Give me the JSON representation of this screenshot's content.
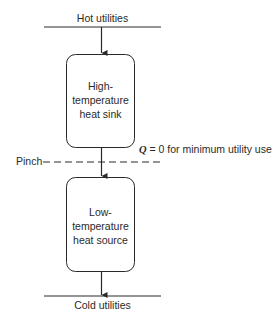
{
  "diagram": {
    "hot_utilities_label": "Hot utilities",
    "cold_utilities_label": "Cold utilities",
    "pinch_label": "Pinch",
    "upper_box": {
      "line1": "High-",
      "line2": "temperature",
      "line3": "heat sink"
    },
    "lower_box": {
      "line1": "Low-",
      "line2": "temperature",
      "line3": "heat source"
    },
    "pinch_annotation": {
      "symbol": "Q",
      "text": " = 0 for minimum utility use"
    },
    "colors": {
      "line": "#2a2a2a",
      "background": "#ffffff"
    }
  }
}
